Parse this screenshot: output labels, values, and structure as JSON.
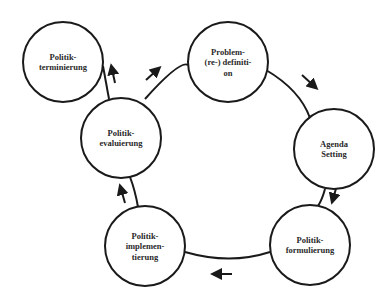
{
  "diagram": {
    "type": "policy-cycle",
    "colors": {
      "stroke": "#1a1a1a",
      "text": "#2a2a2a",
      "background": "#ffffff"
    },
    "nodes": [
      {
        "id": "problem",
        "lines": [
          "Problem-",
          "(re-) definiti-",
          "on"
        ],
        "cx": 228,
        "cy": 62,
        "r": 40
      },
      {
        "id": "agenda",
        "lines": [
          "Agenda",
          "Setting"
        ],
        "cx": 334,
        "cy": 149,
        "r": 40
      },
      {
        "id": "formulierung",
        "lines": [
          "Politik-",
          "formulierung"
        ],
        "cx": 310,
        "cy": 245,
        "r": 40
      },
      {
        "id": "implementierung",
        "lines": [
          "Politik-",
          "implemen-",
          "tierung"
        ],
        "cx": 145,
        "cy": 246,
        "r": 40
      },
      {
        "id": "evaluierung",
        "lines": [
          "Politik-",
          "evaluierung"
        ],
        "cx": 121,
        "cy": 138,
        "r": 40
      },
      {
        "id": "terminierung",
        "lines": [
          "Politik-",
          "terminierung"
        ],
        "cx": 63,
        "cy": 62,
        "r": 40
      }
    ],
    "edges": [
      {
        "from": "problem",
        "to": "agenda",
        "arrow": "down-right"
      },
      {
        "from": "agenda",
        "to": "formulierung",
        "arrow": "down"
      },
      {
        "from": "formulierung",
        "to": "implementierung",
        "arrow": "left"
      },
      {
        "from": "implementierung",
        "to": "evaluierung",
        "arrow": "up"
      },
      {
        "from": "evaluierung",
        "to": "problem",
        "arrow": "up-right"
      },
      {
        "from": "evaluierung",
        "to": "terminierung",
        "arrow": "up"
      }
    ]
  }
}
